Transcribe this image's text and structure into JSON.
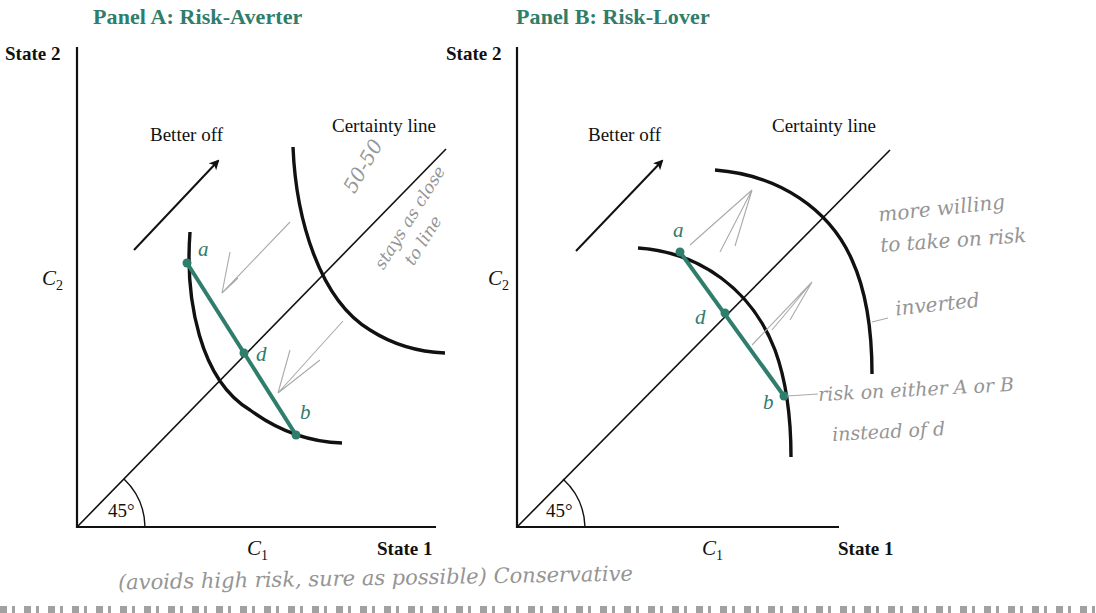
{
  "panels": [
    {
      "id": "A",
      "title": "Panel A:  Risk-Averter",
      "y_axis_label": "State 2",
      "x_axis_label": "State 1",
      "y_var": "C",
      "y_var_sub": "2",
      "x_var": "C",
      "x_var_sub": "1",
      "angle_label": "45°",
      "certainty_line_label": "Certainty line",
      "better_off_label": "Better off",
      "points": {
        "a": "a",
        "d": "d",
        "b": "b"
      },
      "curve_shape": "convex"
    },
    {
      "id": "B",
      "title": "Panel B:  Risk-Lover",
      "y_axis_label": "State 2",
      "x_axis_label": "State 1",
      "y_var": "C",
      "y_var_sub": "2",
      "x_var": "C",
      "x_var_sub": "1",
      "angle_label": "45°",
      "certainty_line_label": "Certainty line",
      "better_off_label": "Better off",
      "points": {
        "a": "a",
        "d": "d",
        "b": "b"
      },
      "curve_shape": "concave"
    }
  ],
  "handwritten_notes": {
    "panel_a_side": [
      "50-50",
      "stays as close",
      "to line"
    ],
    "panel_b_top": [
      "more willing",
      "to take on risk"
    ],
    "panel_b_curve": "inverted",
    "panel_b_point_b": [
      "risk on either A or B",
      "instead of d"
    ],
    "bottom": "(avoids high risk, sure as possible) Conservative"
  },
  "colors": {
    "accent": "#2f7d6b",
    "ink": "#111111",
    "pencil": "#8a8a8a"
  }
}
